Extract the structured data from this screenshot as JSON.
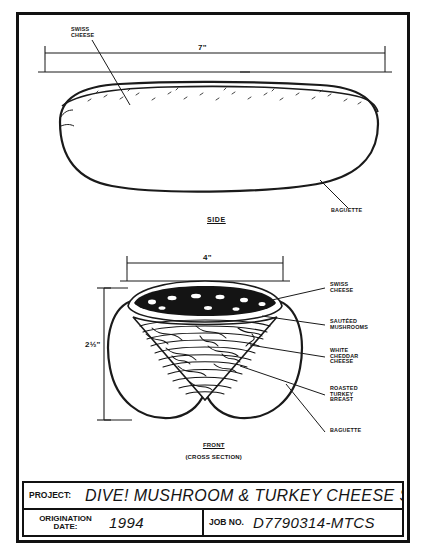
{
  "sheet": {
    "background_color": "#ffffff",
    "ink_color": "#141414"
  },
  "side_view": {
    "caption": "SIDE",
    "dimension_length": "7\"",
    "callouts": [
      {
        "name": "swiss-cheese",
        "text": "SWISS\nCHEESE"
      },
      {
        "name": "baguette",
        "text": "BAGUETTE"
      }
    ]
  },
  "front_view": {
    "caption_line1": "FRONT",
    "caption_line2": "(CROSS SECTION)",
    "dimension_width": "4\"",
    "dimension_height": "2½\"",
    "callouts": [
      {
        "name": "swiss-cheese",
        "text": "SWISS\nCHEESE"
      },
      {
        "name": "sauteed-mushrooms",
        "text": "SAUTÉED\nMUSHROOMS"
      },
      {
        "name": "white-cheddar-cheese",
        "text": "WHITE\nCHEDDAR\nCHEESE"
      },
      {
        "name": "roasted-turkey-breast",
        "text": "ROASTED\nTURKEY\nBREAST"
      },
      {
        "name": "baguette",
        "text": "BAGUETTE"
      }
    ]
  },
  "title_block": {
    "project_label": "PROJECT:",
    "project_value": "DIVE! MUSHROOM & TURKEY CHEESE SUB",
    "origination_label": "ORIGINATION\nDATE:",
    "origination_value": "1994",
    "job_label": "JOB NO.",
    "job_value": "D7790314-MTCS"
  }
}
